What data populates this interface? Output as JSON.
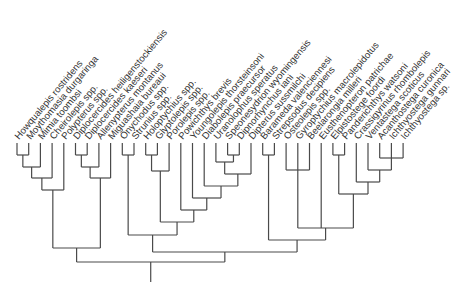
{
  "diagram": {
    "type": "cladogram",
    "colors": {
      "line": "#4a4a4a",
      "text": "#333333",
      "background": "#ffffff"
    },
    "leaf_row": {
      "x0": 17,
      "dx": 11.7,
      "tip_y": 143,
      "label_y": 140,
      "label_angle": -50
    },
    "taxa": [
      "Howqualepis rostridens",
      "Moythomasia durgaringa",
      "Mimia toombsi",
      "Cheirolepis spp.",
      "Polypterus spp.",
      "Diplocercides heiligenstockiensis",
      "Diplocercides kaeseri",
      "Allenypterus montanus",
      "Miguashaia bureaui",
      "Onychodus spp.",
      "Strunius spp.",
      "Holoptychius spp.",
      "Glyptolepis spp.",
      "Porolepis spp.",
      "Powichthys brevis",
      "Youngolepis thorsteinsoni",
      "Diabolepis praecursor",
      "Uranolophus speratus",
      "Speonesydrion wyomingensis",
      "Dipnorhynchus iani",
      "Dipterus sussmilchi",
      "Barameda valenciennesi",
      "Strepsodus decipiens",
      "Osteolepis spp.",
      "Gyroptychius macrolepidotus",
      "Beelarongia milleri",
      "Eusthenopteron patrichae",
      "Elpistostege foordi",
      "Panderichthys watsoni",
      "Crassigyrinus rhombolepis",
      "Ventastega scoticus",
      "Acanthostega curonica",
      "Ichthyostega gunnari",
      "Ichthyostega sp."
    ],
    "tree": {
      "y": 262,
      "root_stub": 282,
      "children": [
        {
          "y": 248,
          "children": [
            {
              "y": 190,
              "children": [
                {
                  "y": 178,
                  "children": [
                    {
                      "y": 167,
                      "children": [
                        {
                          "y": 155,
                          "children": [
                            0,
                            1
                          ]
                        },
                        2
                      ]
                    },
                    3
                  ]
                },
                4
              ]
            },
            {
              "y": 178,
              "children": [
                {
                  "y": 167,
                  "children": [
                    {
                      "y": 155,
                      "children": [
                        5,
                        6
                      ]
                    },
                    7
                  ]
                },
                8
              ]
            }
          ]
        },
        {
          "y": 252,
          "children": [
            {
              "y": 235,
              "children": [
                {
                  "y": 155,
                  "children": [
                    9,
                    10
                  ]
                },
                {
                  "y": 222,
                  "children": [
                    {
                      "y": 171,
                      "children": [
                        {
                          "y": 155,
                          "children": [
                            11,
                            12
                          ]
                        },
                        13
                      ]
                    },
                    {
                      "y": 210,
                      "children": [
                        14,
                        {
                          "y": 198,
                          "children": [
                            15,
                            {
                              "y": 186,
                              "children": [
                                16,
                                {
                                  "y": 174,
                                  "children": [
                                    {
                                      "y": 162,
                                      "children": [
                                        17,
                                        {
                                          "y": 155,
                                          "children": [
                                            18,
                                            19
                                          ]
                                        }
                                      ]
                                    },
                                    20
                                  ]
                                }
                              ]
                            }
                          ]
                        }
                      ]
                    }
                  ]
                }
              ]
            },
            {
              "y": 240,
              "children": [
                {
                  "y": 155,
                  "children": [
                    21,
                    22
                  ]
                },
                {
                  "y": 228,
                  "children": [
                    {
                      "y": 170,
                      "children": [
                        23,
                        24,
                        25
                      ]
                    },
                    26,
                    {
                      "y": 194,
                      "children": [
                        {
                          "y": 155,
                          "children": [
                            27,
                            28
                          ]
                        },
                        {
                          "y": 182,
                          "children": [
                            29,
                            {
                              "y": 170,
                              "children": [
                                30,
                                {
                                  "y": 158,
                                  "children": [
                                    31,
                                    32,
                                    33
                                  ]
                                }
                              ]
                            }
                          ]
                        }
                      ]
                    }
                  ]
                }
              ]
            }
          ]
        }
      ]
    }
  }
}
